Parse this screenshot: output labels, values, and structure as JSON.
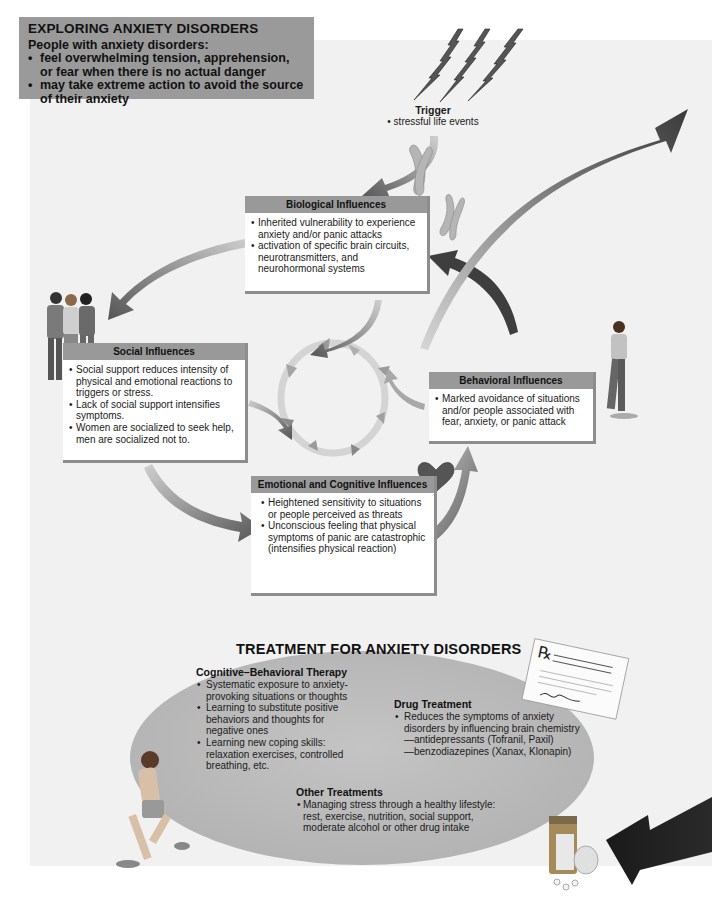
{
  "intro": {
    "title": "EXPLORING ANXIETY DISORDERS",
    "subtitle": "People with anxiety disorders:",
    "items": [
      "feel overwhelming tension, apprehension, or fear when there is no actual danger",
      "may take extreme action to avoid the source of their anxiety"
    ]
  },
  "trigger": {
    "title": "Trigger",
    "text": "• stressful life events",
    "icon": "lightning-bolt-icon"
  },
  "influences": {
    "biological": {
      "title": "Biological Influences",
      "items": [
        "Inherited vulnerability to experience anxiety and/or panic attacks",
        "activation of specific brain circuits, neurotransmitters, and neurohormonal systems"
      ],
      "icon": "chromosome-icon"
    },
    "social": {
      "title": "Social Influences",
      "items": [
        "Social support reduces intensity of physical and emotional reactions to triggers or stress.",
        "Lack of social support intensifies symptoms.",
        "Women are socialized to seek help, men are socialized not to."
      ],
      "icon": "group-of-people-icon"
    },
    "behavioral": {
      "title": "Behavioral Influences",
      "items": [
        "Marked avoidance of situations and/or people associated with fear, anxiety, or panic attack"
      ],
      "icon": "walking-woman-icon"
    },
    "emotional": {
      "title": "Emotional and Cognitive Influences",
      "items": [
        "Heightened sensitivity to situations or people perceived as threats",
        "Unconscious feeling that physical symptoms of panic are catastrophic (intensifies physical reaction)"
      ],
      "icon": "heart-icon"
    }
  },
  "treatment": {
    "title": "TREATMENT FOR ANXIETY DISORDERS",
    "cbt": {
      "title": "Cognitive–Behavioral Therapy",
      "items": [
        "Systematic exposure to anxiety-provoking situations or thoughts",
        "Learning to substitute positive behaviors and thoughts for negative ones",
        "Learning new coping skills: relaxation exercises, controlled breathing, etc."
      ]
    },
    "drug": {
      "title": "Drug Treatment",
      "items": [
        "Reduces the symptoms of anxiety disorders by influencing brain chemistry"
      ],
      "subitems": [
        "—antidepressants (Tofranil, Paxil)",
        "—benzodiazepines (Xanax, Klonapin)"
      ]
    },
    "other": {
      "title": "Other Treatments",
      "items": [
        "Managing stress through a healthy lifestyle: rest, exercise, nutrition, social support, moderate alcohol or other drug intake"
      ]
    },
    "prescription": {
      "symbol": "℞",
      "text": "Take one tablet every 12 hours with food. Take until all medication is"
    }
  },
  "colors": {
    "panel_background": "#f1f1f1",
    "intro_box": "#9a9a9a",
    "box_header": "#999999",
    "ellipse": "#b9b9b9",
    "arrow_dark": "#444444",
    "arrow_light": "#c8c8c8"
  }
}
